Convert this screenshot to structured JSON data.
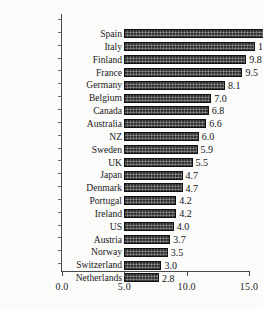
{
  "chart_data": {
    "type": "bar",
    "orientation": "horizontal",
    "title": "",
    "subtitle": "",
    "xlabel": "",
    "ylabel": "",
    "xlim": [
      0.0,
      15.0
    ],
    "xticks": [
      "0.0",
      "5.0",
      "10.0",
      "15.0"
    ],
    "xtick_values": [
      0.0,
      5.0,
      10.0,
      15.0
    ],
    "grid": false,
    "legend": null,
    "bar_color": "#2e2e2e",
    "bar_edge_color": "#111111",
    "axis_color": "#4a4a4a",
    "background_color": "#fbfbfa",
    "categories": [
      "Spain",
      "Italy",
      "Finland",
      "France",
      "Germany",
      "Belgium",
      "Canada",
      "Australia",
      "NZ",
      "Sweden",
      "UK",
      "Japan",
      "Denmark",
      "Portugal",
      "Ireland",
      "US",
      "Austria",
      "Norway",
      "Switzerland",
      "Netherlands"
    ],
    "values": [
      14.1,
      10.5,
      9.8,
      9.5,
      8.1,
      7.0,
      6.8,
      6.6,
      6.0,
      5.9,
      5.5,
      4.7,
      4.7,
      4.2,
      4.2,
      4.0,
      3.7,
      3.5,
      3.0,
      2.8
    ],
    "value_labels": [
      "14.1",
      "10.5",
      "9.8",
      "9.5",
      "8.1",
      "7.0",
      "6.8",
      "6.6",
      "6.0",
      "5.9",
      "5.5",
      "4.7",
      "4.7",
      "4.2",
      "4.2",
      "4.0",
      "3.7",
      "3.5",
      "3.0",
      "2.8"
    ]
  }
}
